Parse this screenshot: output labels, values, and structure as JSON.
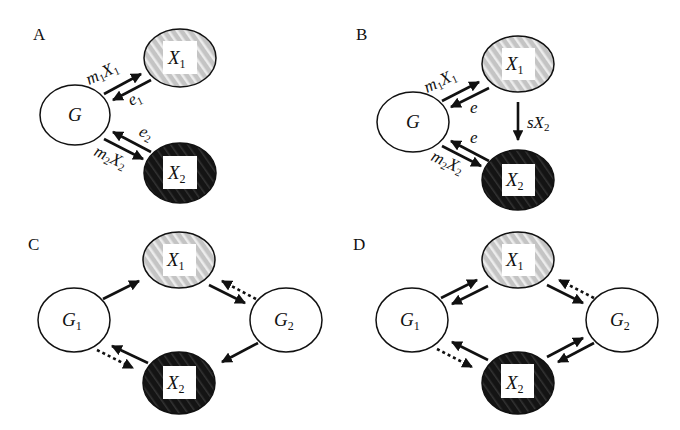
{
  "figure": {
    "background": "#ffffff",
    "colors": {
      "ink": "#111111",
      "x1_fill": "#c4c4c4",
      "x1_stripe": "#ececec",
      "x2_fill": "#141414",
      "x2_stripe": "#3a3a3a",
      "g_fill": "#ffffff"
    },
    "panels": [
      {
        "id": "A",
        "label": "A",
        "nodes": {
          "G": {
            "label": "G",
            "sub": ""
          },
          "X1": {
            "label": "X",
            "sub": "1"
          },
          "X2": {
            "label": "X",
            "sub": "2"
          }
        },
        "edges": [
          {
            "from": "G",
            "to": "X1",
            "style": "solid",
            "label": "m",
            "label_sub": "1",
            "label_tail": "X",
            "label_tail_sub": "1"
          },
          {
            "from": "X1",
            "to": "G",
            "style": "solid",
            "label": "e",
            "label_sub": "1"
          },
          {
            "from": "X2",
            "to": "G",
            "style": "solid",
            "label": "e",
            "label_sub": "2"
          },
          {
            "from": "G",
            "to": "X2",
            "style": "solid",
            "label": "m",
            "label_sub": "2",
            "label_tail": "X",
            "label_tail_sub": "2"
          }
        ]
      },
      {
        "id": "B",
        "label": "B",
        "nodes": {
          "G": {
            "label": "G",
            "sub": ""
          },
          "X1": {
            "label": "X",
            "sub": "1"
          },
          "X2": {
            "label": "X",
            "sub": "2"
          }
        },
        "edges": [
          {
            "from": "G",
            "to": "X1",
            "style": "solid",
            "label": "m",
            "label_sub": "1",
            "label_tail": "X",
            "label_tail_sub": "1"
          },
          {
            "from": "X1",
            "to": "G",
            "style": "solid",
            "label": "e",
            "label_sub": ""
          },
          {
            "from": "X1",
            "to": "X2",
            "style": "solid",
            "label": "sX",
            "label_sub": "2"
          },
          {
            "from": "X2",
            "to": "G",
            "style": "solid",
            "label": "e",
            "label_sub": ""
          },
          {
            "from": "G",
            "to": "X2",
            "style": "solid",
            "label": "m",
            "label_sub": "2",
            "label_tail": "X",
            "label_tail_sub": "2"
          }
        ]
      },
      {
        "id": "C",
        "label": "C",
        "nodes": {
          "G1": {
            "label": "G",
            "sub": "1"
          },
          "G2": {
            "label": "G",
            "sub": "2"
          },
          "X1": {
            "label": "X",
            "sub": "1"
          },
          "X2": {
            "label": "X",
            "sub": "2"
          }
        },
        "edges": [
          {
            "from": "G1",
            "to": "X1",
            "style": "solid"
          },
          {
            "from": "X1",
            "to": "G2",
            "style": "solid"
          },
          {
            "from": "G2",
            "to": "X1",
            "style": "dotted"
          },
          {
            "from": "G2",
            "to": "X2",
            "style": "solid"
          },
          {
            "from": "X2",
            "to": "G1",
            "style": "solid"
          },
          {
            "from": "G1",
            "to": "X2",
            "style": "dotted"
          }
        ]
      },
      {
        "id": "D",
        "label": "D",
        "nodes": {
          "G1": {
            "label": "G",
            "sub": "1"
          },
          "G2": {
            "label": "G",
            "sub": "2"
          },
          "X1": {
            "label": "X",
            "sub": "1"
          },
          "X2": {
            "label": "X",
            "sub": "2"
          }
        },
        "edges": [
          {
            "from": "G1",
            "to": "X1",
            "style": "solid"
          },
          {
            "from": "X1",
            "to": "G1",
            "style": "solid"
          },
          {
            "from": "X1",
            "to": "G2",
            "style": "solid"
          },
          {
            "from": "G2",
            "to": "X1",
            "style": "dotted"
          },
          {
            "from": "X2",
            "to": "G2",
            "style": "solid"
          },
          {
            "from": "G2",
            "to": "X2",
            "style": "solid"
          },
          {
            "from": "X2",
            "to": "G1",
            "style": "solid"
          },
          {
            "from": "G1",
            "to": "X2",
            "style": "dotted"
          }
        ]
      }
    ]
  }
}
